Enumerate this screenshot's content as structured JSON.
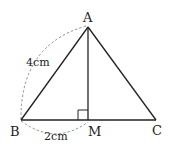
{
  "diagram": {
    "type": "geometry-triangle",
    "points": {
      "A": {
        "label": "A",
        "x": 88,
        "y": 27
      },
      "B": {
        "label": "B",
        "x": 21,
        "y": 120
      },
      "C": {
        "label": "C",
        "x": 156,
        "y": 120
      },
      "M": {
        "label": "M",
        "x": 88,
        "y": 120
      }
    },
    "measurements": {
      "AB": "4cm",
      "BM": "2cm"
    },
    "right_angle_at": "M",
    "stroke_color": "#222222",
    "dash_color": "#777777"
  }
}
